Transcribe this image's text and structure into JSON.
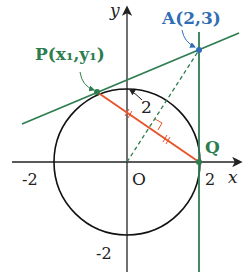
{
  "diagram": {
    "axes": {
      "x_label": "x",
      "y_label": "y",
      "origin_label": "O",
      "x_ticks": [
        "-2",
        "2"
      ],
      "y_ticks": [
        "-2"
      ]
    },
    "circle": {
      "radius_label": "2"
    },
    "points": {
      "A": {
        "label": "A(2,3)",
        "name": "A",
        "coords": "(2,3)"
      },
      "P": {
        "label": "P(x₁,y₁)",
        "name": "P",
        "coords_open": "(",
        "x": "x",
        "y": "y",
        "sub": "1"
      },
      "Q": {
        "label": "Q"
      }
    },
    "colors": {
      "tangent": "#2e7d4f",
      "chord": "#e8552a",
      "point_A": "#2f6db5",
      "axis": "#222222",
      "label_green": "#2e7d4f",
      "label_blue": "#2f6db5"
    }
  }
}
